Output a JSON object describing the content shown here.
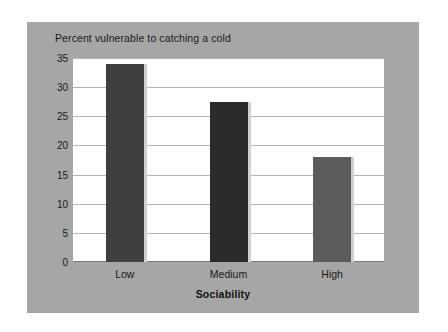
{
  "chart_data": {
    "type": "bar",
    "title": "Percent vulnerable to catching a cold",
    "xlabel": "Sociability",
    "ylabel": "",
    "categories": [
      "Low",
      "Medium",
      "High"
    ],
    "values": [
      34,
      27.5,
      18
    ],
    "ylim": [
      0,
      35
    ],
    "ytick_labels": [
      "0",
      "5",
      "10",
      "15",
      "20",
      "25",
      "30",
      "35"
    ],
    "ytick_values": [
      0,
      5,
      10,
      15,
      20,
      25,
      30,
      35
    ],
    "grid": true,
    "legend": "none",
    "series": [
      {
        "name": "Percent vulnerable to catching a cold",
        "values": [
          34,
          27.5,
          18
        ]
      }
    ],
    "bar_colors": [
      "#3f3f3f",
      "#2b2b2b",
      "#5c5c5c"
    ],
    "colors": {
      "panel_background": "#a6a6a6",
      "plot_background": "#ffffff",
      "gridline": "#b4b4b4",
      "axis": "#7a7a7a",
      "text": "#1a1a1a",
      "figure_background": "#ffffff",
      "bar_shadow": "#d0d0d0"
    }
  }
}
